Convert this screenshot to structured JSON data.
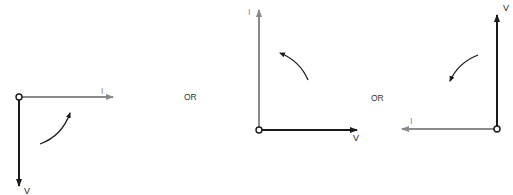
{
  "colors": {
    "voltage": "#1a1a1a",
    "current": "#8a8a8a",
    "rotation": "#1a1a1a",
    "background": "#ffffff"
  },
  "separators": [
    "OR",
    "OR"
  ],
  "diagrams": [
    {
      "id": "phasor-1",
      "voltage_label": "V",
      "current_label": "I",
      "voltage_direction": "down",
      "current_direction": "right",
      "rotation": "counterclockwise"
    },
    {
      "id": "phasor-2",
      "voltage_label": "V",
      "current_label": "I",
      "voltage_direction": "right",
      "current_direction": "up",
      "rotation": "counterclockwise"
    },
    {
      "id": "phasor-3",
      "voltage_label": "V",
      "current_label": "I",
      "voltage_direction": "up",
      "current_direction": "left",
      "rotation": "counterclockwise"
    }
  ]
}
